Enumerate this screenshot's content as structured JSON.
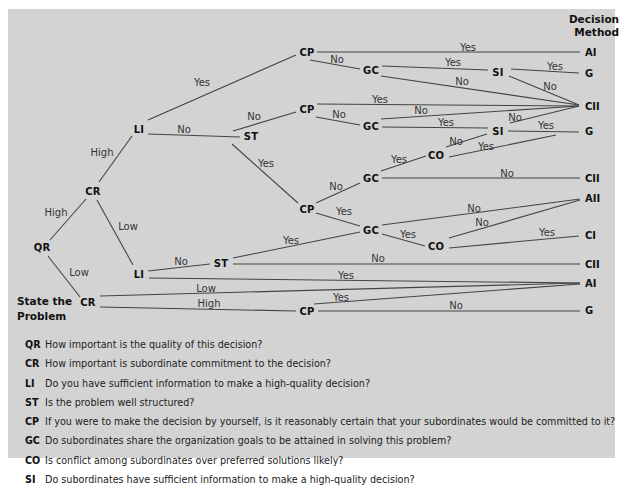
{
  "header": {
    "line1": "Decision",
    "line2": "Method"
  },
  "start": {
    "line1": "State the",
    "line2": "Problem"
  },
  "colors": {
    "panel": "#d3d3d3",
    "line": "#444444",
    "text": "#111111"
  },
  "nodes": [
    {
      "id": "qr",
      "label": "QR",
      "x": 42,
      "y": 247
    },
    {
      "id": "cr1",
      "label": "CR",
      "x": 93,
      "y": 191
    },
    {
      "id": "li1",
      "label": "LI",
      "x": 139,
      "y": 129
    },
    {
      "id": "st1",
      "label": "ST",
      "x": 251,
      "y": 136
    },
    {
      "id": "cp1",
      "label": "CP",
      "x": 307,
      "y": 52
    },
    {
      "id": "gc1",
      "label": "GC",
      "x": 371,
      "y": 70
    },
    {
      "id": "si1",
      "label": "SI",
      "x": 498,
      "y": 72
    },
    {
      "id": "cp2",
      "label": "CP",
      "x": 307,
      "y": 109
    },
    {
      "id": "gc2",
      "label": "GC",
      "x": 371,
      "y": 126
    },
    {
      "id": "si2",
      "label": "SI",
      "x": 498,
      "y": 131
    },
    {
      "id": "co1",
      "label": "CO",
      "x": 436,
      "y": 155
    },
    {
      "id": "gc3",
      "label": "GC",
      "x": 371,
      "y": 178
    },
    {
      "id": "cp3",
      "label": "CP",
      "x": 307,
      "y": 209
    },
    {
      "id": "gc4",
      "label": "GC",
      "x": 371,
      "y": 230
    },
    {
      "id": "co2",
      "label": "CO",
      "x": 436,
      "y": 246
    },
    {
      "id": "li2",
      "label": "LI",
      "x": 139,
      "y": 274
    },
    {
      "id": "st2",
      "label": "ST",
      "x": 221,
      "y": 263
    },
    {
      "id": "cr2",
      "label": "CR",
      "x": 88,
      "y": 302
    },
    {
      "id": "cp4",
      "label": "CP",
      "x": 307,
      "y": 311
    }
  ],
  "outcomes": [
    {
      "label": "AI",
      "x": 585,
      "y": 52
    },
    {
      "label": "G",
      "x": 585,
      "y": 73
    },
    {
      "label": "CII",
      "x": 585,
      "y": 106
    },
    {
      "label": "G",
      "x": 585,
      "y": 131
    },
    {
      "label": "CII",
      "x": 585,
      "y": 178
    },
    {
      "label": "AII",
      "x": 585,
      "y": 198
    },
    {
      "label": "CI",
      "x": 585,
      "y": 235
    },
    {
      "label": "CII",
      "x": 585,
      "y": 264
    },
    {
      "label": "AI",
      "x": 585,
      "y": 283
    },
    {
      "label": "G",
      "x": 585,
      "y": 310
    }
  ],
  "edges": [
    {
      "x1": 50,
      "y1": 240,
      "x2": 86,
      "y2": 199,
      "label": "High",
      "lx": 56,
      "ly": 212
    },
    {
      "x1": 48,
      "y1": 256,
      "x2": 80,
      "y2": 297,
      "label": "Low",
      "lx": 79,
      "ly": 272
    },
    {
      "x1": 99,
      "y1": 182,
      "x2": 132,
      "y2": 136,
      "label": "High",
      "lx": 102,
      "ly": 152
    },
    {
      "x1": 97,
      "y1": 200,
      "x2": 133,
      "y2": 265,
      "label": "Low",
      "lx": 128,
      "ly": 226
    },
    {
      "x1": 148,
      "y1": 120,
      "x2": 296,
      "y2": 55,
      "label": "Yes",
      "lx": 202,
      "ly": 82
    },
    {
      "x1": 148,
      "y1": 134,
      "x2": 240,
      "y2": 137,
      "label": "No",
      "lx": 184,
      "ly": 129
    },
    {
      "x1": 233,
      "y1": 131,
      "x2": 296,
      "y2": 112,
      "label": "No",
      "lx": 254,
      "ly": 116
    },
    {
      "x1": 232,
      "y1": 144,
      "x2": 298,
      "y2": 203,
      "label": "Yes",
      "lx": 266,
      "ly": 163
    },
    {
      "x1": 317,
      "y1": 52,
      "x2": 580,
      "y2": 52,
      "label": "Yes",
      "lx": 468,
      "ly": 47
    },
    {
      "x1": 310,
      "y1": 60,
      "x2": 360,
      "y2": 69,
      "label": "No",
      "lx": 337,
      "ly": 59
    },
    {
      "x1": 382,
      "y1": 66,
      "x2": 488,
      "y2": 70,
      "label": "Yes",
      "lx": 453,
      "ly": 62
    },
    {
      "x1": 381,
      "y1": 76,
      "x2": 579,
      "y2": 105,
      "label": "No",
      "lx": 462,
      "ly": 81
    },
    {
      "x1": 511,
      "y1": 69,
      "x2": 579,
      "y2": 73,
      "label": "Yes",
      "lx": 555,
      "ly": 66
    },
    {
      "x1": 509,
      "y1": 76,
      "x2": 579,
      "y2": 105,
      "label": "No",
      "lx": 550,
      "ly": 86
    },
    {
      "x1": 317,
      "y1": 104,
      "x2": 579,
      "y2": 106,
      "label": "Yes",
      "lx": 380,
      "ly": 99
    },
    {
      "x1": 316,
      "y1": 117,
      "x2": 360,
      "y2": 125,
      "label": "No",
      "lx": 339,
      "ly": 114
    },
    {
      "x1": 381,
      "y1": 119,
      "x2": 579,
      "y2": 106,
      "label": "No",
      "lx": 421,
      "ly": 110
    },
    {
      "x1": 382,
      "y1": 127,
      "x2": 488,
      "y2": 128,
      "label": "Yes",
      "lx": 446,
      "ly": 122
    },
    {
      "x1": 508,
      "y1": 131,
      "x2": 579,
      "y2": 132,
      "label": "Yes",
      "lx": 546,
      "ly": 125
    },
    {
      "x1": 510,
      "y1": 123,
      "x2": 579,
      "y2": 106,
      "label": "No",
      "lx": 515,
      "ly": 117
    },
    {
      "x1": 446,
      "y1": 147,
      "x2": 487,
      "y2": 134,
      "label": "No",
      "lx": 456,
      "ly": 141
    },
    {
      "x1": 449,
      "y1": 157,
      "x2": 556,
      "y2": 135,
      "label": "Yes",
      "lx": 486,
      "ly": 146
    },
    {
      "x1": 381,
      "y1": 171,
      "x2": 426,
      "y2": 156,
      "label": "Yes",
      "lx": 399,
      "ly": 159
    },
    {
      "x1": 382,
      "y1": 178,
      "x2": 580,
      "y2": 178,
      "label": "No",
      "lx": 507,
      "ly": 173
    },
    {
      "x1": 316,
      "y1": 203,
      "x2": 360,
      "y2": 183,
      "label": "No",
      "lx": 336,
      "ly": 186
    },
    {
      "x1": 316,
      "y1": 213,
      "x2": 360,
      "y2": 226,
      "label": "Yes",
      "lx": 344,
      "ly": 211
    },
    {
      "x1": 382,
      "y1": 225,
      "x2": 580,
      "y2": 199,
      "label": "No",
      "lx": 474,
      "ly": 208
    },
    {
      "x1": 382,
      "y1": 234,
      "x2": 425,
      "y2": 246,
      "label": "Yes",
      "lx": 408,
      "ly": 234
    },
    {
      "x1": 449,
      "y1": 238,
      "x2": 580,
      "y2": 200,
      "label": "No",
      "lx": 482,
      "ly": 222
    },
    {
      "x1": 449,
      "y1": 248,
      "x2": 579,
      "y2": 236,
      "label": "Yes",
      "lx": 547,
      "ly": 232
    },
    {
      "x1": 233,
      "y1": 258,
      "x2": 360,
      "y2": 232,
      "label": "Yes",
      "lx": 291,
      "ly": 240
    },
    {
      "x1": 148,
      "y1": 271,
      "x2": 210,
      "y2": 264,
      "label": "No",
      "lx": 181,
      "ly": 261
    },
    {
      "x1": 233,
      "y1": 264,
      "x2": 580,
      "y2": 264,
      "label": "No",
      "lx": 378,
      "ly": 258
    },
    {
      "x1": 149,
      "y1": 278,
      "x2": 580,
      "y2": 283,
      "label": "Yes",
      "lx": 346,
      "ly": 275
    },
    {
      "x1": 100,
      "y1": 296,
      "x2": 580,
      "y2": 283,
      "label": "Low",
      "lx": 206,
      "ly": 288
    },
    {
      "x1": 100,
      "y1": 307,
      "x2": 296,
      "y2": 311,
      "label": "High",
      "lx": 209,
      "ly": 303
    },
    {
      "x1": 314,
      "y1": 304,
      "x2": 580,
      "y2": 284,
      "label": "Yes",
      "lx": 341,
      "ly": 297
    },
    {
      "x1": 318,
      "y1": 311,
      "x2": 580,
      "y2": 311,
      "label": "No",
      "lx": 456,
      "ly": 305
    }
  ],
  "legend": [
    {
      "code": "QR",
      "text": "How important is the quality of this decision?"
    },
    {
      "code": "CR",
      "text": "How important is subordinate commitment to the decision?"
    },
    {
      "code": "LI",
      "text": "Do you have sufficient information to make a high-quality decision?"
    },
    {
      "code": "ST",
      "text": "Is the problem well structured?"
    },
    {
      "code": "CP",
      "text": "If you were to make the decision by yourself, is it reasonably certain that your subordinates would be committed to it?"
    },
    {
      "code": "GC",
      "text": "Do subordinates share the organization goals to be attained in solving this problem?"
    },
    {
      "code": "CO",
      "text": "Is conflict among subordinates over preferred solutions likely?"
    },
    {
      "code": "SI",
      "text": "Do subordinates have sufficient information to make a high-quality decision?"
    }
  ]
}
